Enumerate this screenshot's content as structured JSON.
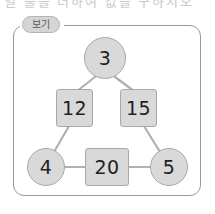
{
  "canvas": {
    "width": 215,
    "height": 214,
    "background": "#ffffff"
  },
  "top_strip": {
    "clipped_text": "열 물을   더하여   값을   구하시오"
  },
  "legend": {
    "label": "보기",
    "badge_fill": "#d5d5d5",
    "badge_border": "#b4b4b4",
    "text_color": "#595959"
  },
  "frame": {
    "border_color": "#9a9a9a",
    "corner_radius": 11
  },
  "diagram": {
    "type": "triangle-number-puzzle",
    "node_fill": "#d9d9d9",
    "node_border": "#a8a8a8",
    "number_color": "#1f1f1f",
    "line_color": "#b0b0b0",
    "nodes": [
      {
        "id": "top",
        "value": "3",
        "shape": "circle",
        "position": "top-apex"
      },
      {
        "id": "left-upper",
        "value": "12",
        "shape": "square",
        "position": "left-edge-mid"
      },
      {
        "id": "right-upper",
        "value": "15",
        "shape": "square",
        "position": "right-edge-mid"
      },
      {
        "id": "bottom-left",
        "value": "4",
        "shape": "circle",
        "position": "bottom-left-vertex"
      },
      {
        "id": "bottom-mid",
        "value": "20",
        "shape": "square",
        "position": "bottom-edge-mid"
      },
      {
        "id": "bottom-right",
        "value": "5",
        "shape": "circle",
        "position": "bottom-right-vertex"
      }
    ],
    "edges": [
      {
        "from": "top",
        "to": "left-upper"
      },
      {
        "from": "top",
        "to": "right-upper"
      },
      {
        "from": "left-upper",
        "to": "bottom-left"
      },
      {
        "from": "right-upper",
        "to": "bottom-right"
      },
      {
        "from": "bottom-left",
        "to": "bottom-mid"
      },
      {
        "from": "bottom-mid",
        "to": "bottom-right"
      }
    ]
  }
}
